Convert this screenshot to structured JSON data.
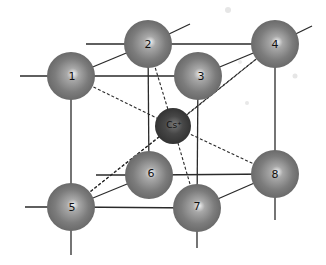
{
  "diagram": {
    "center_ion": {
      "label": "Cs+",
      "display": "Cs⁺",
      "x": 173,
      "y": 126,
      "r": 18,
      "color": "#3c3c3c"
    },
    "corner_ions": [
      {
        "id": "1",
        "label": "1",
        "x": 71,
        "y": 76,
        "r": 24
      },
      {
        "id": "2",
        "label": "2",
        "x": 148,
        "y": 44,
        "r": 24
      },
      {
        "id": "3",
        "label": "3",
        "x": 198,
        "y": 76,
        "r": 24
      },
      {
        "id": "4",
        "label": "4",
        "x": 275,
        "y": 44,
        "r": 24
      },
      {
        "id": "5",
        "label": "5",
        "x": 71,
        "y": 207,
        "r": 24
      },
      {
        "id": "6",
        "label": "6",
        "x": 149,
        "y": 175,
        "r": 24
      },
      {
        "id": "7",
        "label": "7",
        "x": 197,
        "y": 208,
        "r": 24
      },
      {
        "id": "8",
        "label": "8",
        "x": 275,
        "y": 174,
        "r": 24
      }
    ],
    "sphere_color": "#7a7a7a",
    "line_color": "#2a2a2a",
    "solid_edges": [
      [
        "1",
        "2"
      ],
      [
        "1",
        "3"
      ],
      [
        "2",
        "4"
      ],
      [
        "3",
        "4"
      ],
      [
        "1",
        "5"
      ],
      [
        "3",
        "7"
      ],
      [
        "2",
        "6"
      ],
      [
        "4",
        "8"
      ],
      [
        "5",
        "6"
      ],
      [
        "5",
        "7"
      ],
      [
        "6",
        "8"
      ],
      [
        "7",
        "8"
      ]
    ],
    "dashed_edges": [
      [
        "1",
        "Cs+"
      ],
      [
        "2",
        "Cs+"
      ],
      [
        "4",
        "Cs+"
      ],
      [
        "5",
        "Cs+"
      ],
      [
        "7",
        "Cs+"
      ],
      [
        "8",
        "Cs+"
      ],
      [
        "3",
        "Cs+"
      ],
      [
        "6",
        "Cs+"
      ]
    ]
  }
}
